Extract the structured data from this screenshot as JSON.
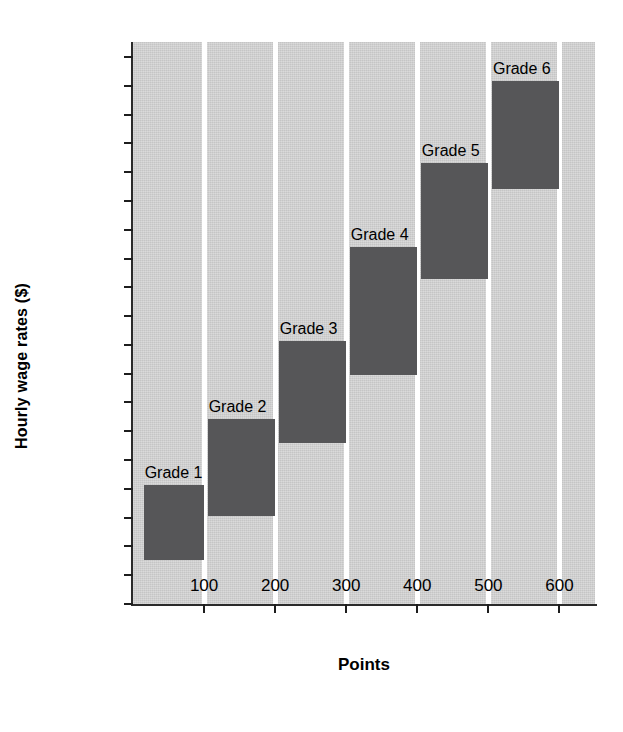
{
  "chart_data": {
    "type": "bar",
    "title": "",
    "xlabel": "Points",
    "ylabel": "Hourly wage rates ($)",
    "xlim": [
      0,
      650
    ],
    "ylim": [
      10.0,
      14.88
    ],
    "grid": false,
    "legend": "none",
    "y_ticks": [
      "10.00",
      "10.25",
      "10.50",
      "10.75",
      "11.00",
      "11.25",
      "11.50",
      "11.75",
      "12.00",
      "12.25",
      "12.50",
      "12.75",
      "13.00",
      "13.25",
      "13.50",
      "13.75",
      "14.00",
      "14.25",
      "14.50",
      "14.75"
    ],
    "y_tick_values": [
      10.0,
      10.25,
      10.5,
      10.75,
      11.0,
      11.25,
      11.5,
      11.75,
      12.0,
      12.25,
      12.5,
      12.75,
      13.0,
      13.25,
      13.5,
      13.75,
      14.0,
      14.25,
      14.5,
      14.75
    ],
    "x_ticks": [
      "100",
      "200",
      "300",
      "400",
      "500",
      "600"
    ],
    "x_tick_values": [
      100,
      200,
      300,
      400,
      500,
      600
    ],
    "bar_color": "#565658",
    "plot_background": "#d3d3d3",
    "separator_color": "#ffffff",
    "categories": [
      "Grade 1",
      "Grade 2",
      "Grade 3",
      "Grade 4",
      "Grade 5",
      "Grade 6"
    ],
    "bars": [
      {
        "label": "Grade 1",
        "x_start": 15,
        "x_end": 100,
        "y_low": 10.38,
        "y_high": 11.03
      },
      {
        "label": "Grade 2",
        "x_start": 105,
        "x_end": 200,
        "y_low": 10.76,
        "y_high": 11.61
      },
      {
        "label": "Grade 3",
        "x_start": 205,
        "x_end": 300,
        "y_low": 11.4,
        "y_high": 12.28
      },
      {
        "label": "Grade 4",
        "x_start": 305,
        "x_end": 400,
        "y_low": 11.99,
        "y_high": 13.1
      },
      {
        "label": "Grade 5",
        "x_start": 405,
        "x_end": 500,
        "y_low": 12.82,
        "y_high": 13.83
      },
      {
        "label": "Grade 6",
        "x_start": 505,
        "x_end": 600,
        "y_low": 13.6,
        "y_high": 14.54
      }
    ],
    "separators_at_points": [
      100,
      200,
      300,
      400,
      500,
      600
    ]
  }
}
